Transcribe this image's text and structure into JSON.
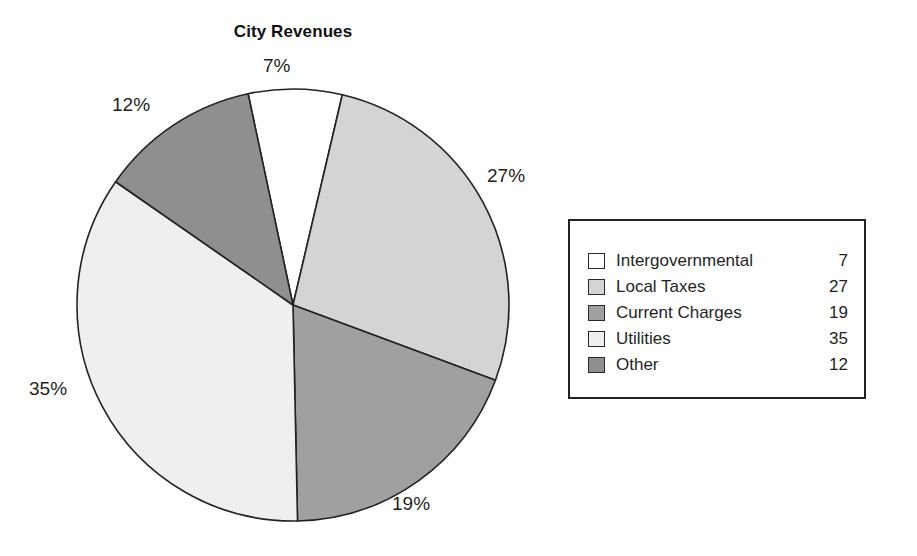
{
  "chart_data": {
    "type": "pie",
    "title": "City Revenues",
    "xlabel": "",
    "ylabel": "",
    "legend_position": "right",
    "grid": false,
    "categories": [
      "Intergovernmental",
      "Local Taxes",
      "Current Charges",
      "Utilities",
      "Other"
    ],
    "values": [
      7,
      27,
      19,
      35,
      12
    ],
    "percent_labels": [
      "7%",
      "27%",
      "19%",
      "35%",
      "12%"
    ],
    "slice_colors": [
      "#ffffff",
      "#d4d4d4",
      "#a0a0a0",
      "#efefef",
      "#8f8f8f"
    ],
    "start_angle_deg": -12,
    "direction": "clockwise",
    "slices": [
      {
        "label": "Intergovernmental",
        "value": 7,
        "percent": "7%",
        "color": "#ffffff"
      },
      {
        "label": "Local Taxes",
        "value": 27,
        "percent": "27%",
        "color": "#d4d4d4"
      },
      {
        "label": "Current Charges",
        "value": 19,
        "percent": "19%",
        "color": "#a0a0a0"
      },
      {
        "label": "Utilities",
        "value": 35,
        "percent": "35%",
        "color": "#efefef"
      },
      {
        "label": "Other",
        "value": 12,
        "percent": "12%",
        "color": "#8f8f8f"
      }
    ]
  },
  "title": "City Revenues",
  "labels": {
    "intergovernmental_pct": "7%",
    "local_taxes_pct": "27%",
    "current_charges_pct": "19%",
    "utilities_pct": "35%",
    "other_pct": "12%"
  },
  "legend": {
    "rows": [
      {
        "label": "Intergovernmental",
        "value": "7"
      },
      {
        "label": "Local Taxes",
        "value": "27"
      },
      {
        "label": "Current Charges",
        "value": "19"
      },
      {
        "label": "Utilities",
        "value": "35"
      },
      {
        "label": "Other",
        "value": "12"
      }
    ]
  },
  "colors": {
    "outline": "#222222",
    "text": "#1f1f1f",
    "background": "#ffffff"
  }
}
